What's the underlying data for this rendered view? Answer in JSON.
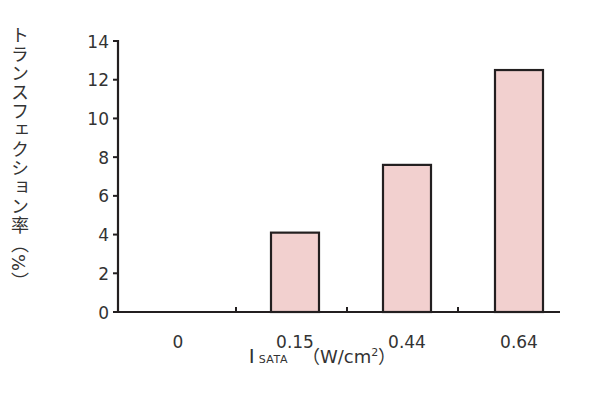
{
  "chart_data": {
    "type": "bar",
    "title": "",
    "categories": [
      "0",
      "0.15",
      "0.44",
      "0.64"
    ],
    "values": [
      0,
      4.1,
      7.6,
      12.5
    ],
    "xlabel": "I SATA (W/cm2)",
    "ylabel": "トランスフェクション率（%）",
    "ylim": [
      0,
      14
    ],
    "yticks": [
      0,
      2,
      4,
      6,
      8,
      10,
      12,
      14
    ],
    "grid": false,
    "legend": null,
    "bar_color": "#f2d0cf",
    "bar_edge_color": "#231f20"
  },
  "labels": {
    "ylabel": "トランスフェクション率（%）",
    "xlabel_symbol": "I",
    "xlabel_subscript": "SATA",
    "xlabel_unit": "（W/cm",
    "xlabel_exp": "2",
    "xlabel_close": "）"
  }
}
